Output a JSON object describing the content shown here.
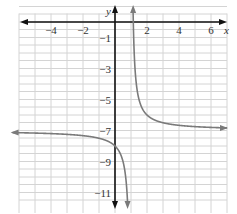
{
  "chart_data": {
    "type": "line",
    "title": "",
    "xlabel": "x",
    "ylabel": "y",
    "xlim": [
      -6,
      7
    ],
    "ylim": [
      -12,
      1
    ],
    "grid": true,
    "x_tick_labels": [
      "−4",
      "−2",
      "2",
      "4",
      "6"
    ],
    "x_ticks": [
      -4,
      -2,
      2,
      4,
      6
    ],
    "y_tick_labels": [
      "−1",
      "−3",
      "−5",
      "−7",
      "−9",
      "−11"
    ],
    "y_ticks": [
      -1,
      -3,
      -5,
      -7,
      -9,
      -11
    ],
    "series": [
      {
        "name": "y = 1/(x − 1) − 7",
        "vertical_asymptote": 1,
        "horizontal_asymptote": -7,
        "points_left_branch": [
          [
            -6,
            -7.14
          ],
          [
            -4,
            -7.2
          ],
          [
            -2,
            -7.33
          ],
          [
            -1,
            -7.5
          ],
          [
            0,
            -8
          ],
          [
            0.5,
            -9
          ],
          [
            0.8,
            -12
          ]
        ],
        "points_right_branch": [
          [
            1.08,
            1
          ],
          [
            1.2,
            -2
          ],
          [
            1.5,
            -5
          ],
          [
            2,
            -6
          ],
          [
            3,
            -6.5
          ],
          [
            5,
            -6.75
          ],
          [
            7,
            -6.83
          ]
        ]
      }
    ],
    "colors": {
      "curve": "#7a7a7a",
      "axes": "#111111",
      "grid": "#d4d4d4"
    }
  }
}
